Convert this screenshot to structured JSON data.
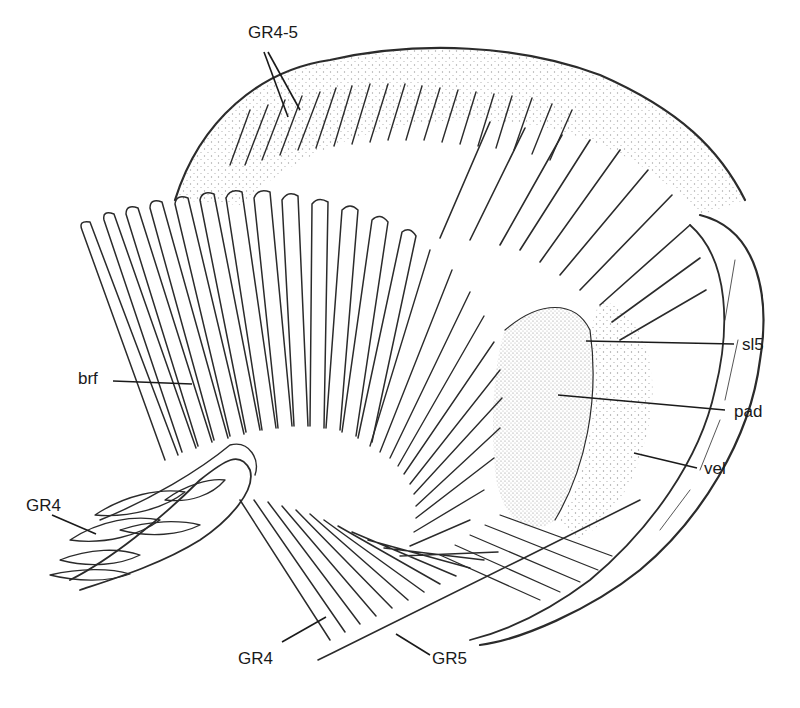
{
  "figure": {
    "type": "anatomical line drawing",
    "colors": {
      "ink": "#2b2b2b",
      "background": "#ffffff",
      "stipple": "#555555"
    }
  },
  "labels": {
    "gr45": {
      "text": "GR4-5",
      "x": 248,
      "y": 24
    },
    "brf": {
      "text": "brf",
      "x": 78,
      "y": 370
    },
    "gr4_left": {
      "text": "GR4",
      "x": 26,
      "y": 497
    },
    "sl5": {
      "text": "sl5",
      "x": 742,
      "y": 336
    },
    "pad": {
      "text": "pad",
      "x": 734,
      "y": 403
    },
    "vel": {
      "text": "vel",
      "x": 704,
      "y": 460
    },
    "gr4_bottom": {
      "text": "GR4",
      "x": 238,
      "y": 650
    },
    "gr5": {
      "text": "GR5",
      "x": 432,
      "y": 650
    }
  }
}
